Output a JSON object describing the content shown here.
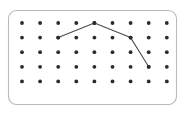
{
  "figure": {
    "name": "geoboard-dot-grid",
    "type": "geoboard",
    "title": "",
    "background_color": "#ffffff"
  },
  "board": {
    "frame": {
      "x": 8.5,
      "y": 10.5,
      "width": 168,
      "height": 94,
      "corner_radius": 8,
      "stroke_color": "#b9b9b9",
      "fill_color": "#ffffff",
      "stroke_width": 1.1
    },
    "grid": {
      "columns": 9,
      "rows": 5,
      "origin_x": 22,
      "origin_y": 23,
      "spacing_x": 18.1,
      "spacing_y": 14.6,
      "dot_radius": 1.9,
      "dot_color": "#2b2b2b",
      "total_dots": 45
    }
  },
  "polyline": {
    "name": "rubber-band-path",
    "stroke_color": "#4a4a4a",
    "stroke_width": 1.05,
    "closed": false,
    "vertex_count": 4,
    "vertices": [
      {
        "label": "start",
        "col": 2,
        "row": 1
      },
      {
        "label": "peak",
        "col": 4,
        "row": 0
      },
      {
        "label": "bend",
        "col": 6,
        "row": 1
      },
      {
        "label": "end",
        "col": 7,
        "row": 3
      }
    ],
    "segments": [
      {
        "from": 0,
        "to": 1,
        "direction": "up-right"
      },
      {
        "from": 1,
        "to": 2,
        "direction": "down-right"
      },
      {
        "from": 2,
        "to": 3,
        "direction": "down-right-steep"
      }
    ]
  },
  "chart_data": {
    "type": "scatter",
    "title": "",
    "xlabel": "",
    "ylabel": "",
    "grid": true,
    "legend": "none",
    "xlim": [
      0,
      8
    ],
    "ylim": [
      0,
      4
    ],
    "categories": [
      "c0",
      "c1",
      "c2",
      "c3",
      "c4",
      "c5",
      "c6",
      "c7",
      "c8"
    ],
    "series": [
      {
        "name": "pegs",
        "kind": "scatter",
        "x": [
          0,
          1,
          2,
          3,
          4,
          5,
          6,
          7,
          8,
          0,
          1,
          2,
          3,
          4,
          5,
          6,
          7,
          8,
          0,
          1,
          2,
          3,
          4,
          5,
          6,
          7,
          8,
          0,
          1,
          2,
          3,
          4,
          5,
          6,
          7,
          8,
          0,
          1,
          2,
          3,
          4,
          5,
          6,
          7,
          8
        ],
        "y": [
          0,
          0,
          0,
          0,
          0,
          0,
          0,
          0,
          0,
          1,
          1,
          1,
          1,
          1,
          1,
          1,
          1,
          1,
          2,
          2,
          2,
          2,
          2,
          2,
          2,
          2,
          2,
          3,
          3,
          3,
          3,
          3,
          3,
          3,
          3,
          3,
          4,
          4,
          4,
          4,
          4,
          4,
          4,
          4,
          4
        ]
      },
      {
        "name": "path",
        "kind": "line",
        "x": [
          2,
          4,
          6,
          7
        ],
        "y": [
          1,
          0,
          1,
          3
        ]
      }
    ]
  }
}
